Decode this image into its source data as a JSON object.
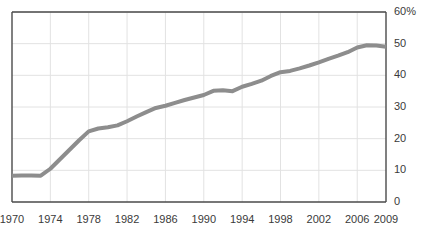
{
  "chart_data": {
    "type": "line",
    "title": "",
    "subtitle": "",
    "xlabel": "",
    "ylabel": "",
    "grid": true,
    "legend_position": "none",
    "xlim": [
      1970,
      2009
    ],
    "ylim": [
      0,
      60
    ],
    "x_tick_labels": [
      "1970",
      "1974",
      "1978",
      "1982",
      "1986",
      "1990",
      "1994",
      "1998",
      "2002",
      "2006",
      "2009"
    ],
    "x_ticks": [
      1970,
      1974,
      1978,
      1982,
      1986,
      1990,
      1994,
      1998,
      2002,
      2006,
      2009
    ],
    "y_tick_labels": [
      "0",
      "10",
      "20",
      "30",
      "40",
      "50",
      "60%"
    ],
    "y_ticks": [
      0,
      10,
      20,
      30,
      40,
      50,
      60
    ],
    "series": [
      {
        "name": "percentage",
        "color": "#8d8d8d",
        "line_width": 4,
        "x": [
          1970,
          1971,
          1972,
          1973,
          1974,
          1975,
          1976,
          1977,
          1978,
          1979,
          1980,
          1981,
          1982,
          1983,
          1984,
          1985,
          1986,
          1987,
          1988,
          1989,
          1990,
          1991,
          1992,
          1993,
          1994,
          1995,
          1996,
          1997,
          1998,
          1999,
          2000,
          2001,
          2002,
          2003,
          2004,
          2005,
          2006,
          2007,
          2008,
          2009
        ],
        "values": [
          8.3,
          8.4,
          8.4,
          8.3,
          10.5,
          13.5,
          16.5,
          19.5,
          22.3,
          23.2,
          23.6,
          24.2,
          25.5,
          27.0,
          28.4,
          29.7,
          30.4,
          31.3,
          32.2,
          33.0,
          33.8,
          35.1,
          35.3,
          35.0,
          36.4,
          37.3,
          38.3,
          39.8,
          41.0,
          41.4,
          42.2,
          43.1,
          44.1,
          45.2,
          46.2,
          47.3,
          48.8,
          49.5,
          49.4,
          49.0
        ]
      }
    ]
  },
  "axes": {
    "y_axis_unit_suffix": "%",
    "plot_background": "#ffffff",
    "gridline_color": "#e2e2e2",
    "axis_line_color": "#4a4a4a",
    "tick_text_color": "#3a3a3a"
  }
}
